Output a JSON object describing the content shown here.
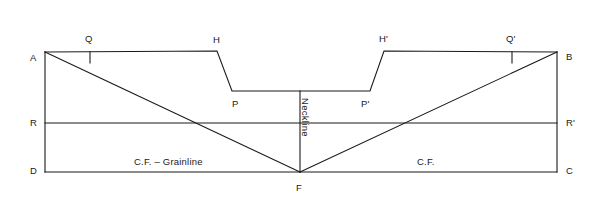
{
  "diagram": {
    "type": "pattern-draft",
    "canvas": {
      "width": 602,
      "height": 205
    },
    "style": {
      "line_color": "#1a1a1a",
      "background_color": "#ffffff",
      "line_width": 1.1,
      "text_color": "#1a1a1a"
    },
    "points": {
      "A": {
        "x": 45,
        "y": 52,
        "label": "A",
        "label_x": 30,
        "label_y": 53
      },
      "B": {
        "x": 557,
        "y": 52,
        "label": "B",
        "label_x": 566,
        "label_y": 52
      },
      "C": {
        "x": 557,
        "y": 172,
        "label": "C",
        "label_x": 566,
        "label_y": 166
      },
      "D": {
        "x": 45,
        "y": 172,
        "label": "D",
        "label_x": 30,
        "label_y": 166
      },
      "F": {
        "x": 300,
        "y": 172,
        "label": "F",
        "label_x": 296,
        "label_y": 183
      },
      "H": {
        "x": 217,
        "y": 51,
        "label": "H",
        "label_x": 213,
        "label_y": 36
      },
      "Hp": {
        "x": 384,
        "y": 51,
        "label": "H'",
        "label_x": 379,
        "label_y": 35
      },
      "P": {
        "x": 232,
        "y": 91,
        "label": "P",
        "label_x": 232,
        "label_y": 99
      },
      "Pp": {
        "x": 370,
        "y": 91,
        "label": "P'",
        "label_x": 361,
        "label_y": 99
      },
      "Q": {
        "x": 90,
        "y": 52,
        "label": "Q",
        "label_x": 85,
        "label_y": 35
      },
      "Qp": {
        "x": 512,
        "y": 52,
        "label": "Q'",
        "label_x": 507,
        "label_y": 35
      },
      "R": {
        "x": 45,
        "y": 123,
        "label": "R",
        "label_x": 30,
        "label_y": 118
      },
      "Rp": {
        "x": 557,
        "y": 123,
        "label": "R'",
        "label_x": 566,
        "label_y": 118
      }
    },
    "annotations": {
      "grainline": {
        "text": "C.F. – Grainline",
        "x": 173,
        "y": 158
      },
      "center_front": {
        "text": "C.F.",
        "x": 427,
        "y": 158
      },
      "neckline": {
        "text": "Neckline",
        "x": 304,
        "y": 98
      }
    },
    "ticks": {
      "Q": {
        "x": 90,
        "y_start": 52,
        "y_end": 63
      },
      "Qp": {
        "x": 512,
        "y_start": 52,
        "y_end": 63
      }
    },
    "segments": [
      {
        "name": "left-edge-AD",
        "from": "A",
        "to": "D"
      },
      {
        "name": "right-edge-BC",
        "from": "B",
        "to": "C"
      },
      {
        "name": "bottom-edge-DC",
        "from": "D",
        "to": "C"
      },
      {
        "name": "waist-line-RR",
        "from": "R",
        "to": "Rp"
      },
      {
        "name": "top-edge-AH",
        "from": "A",
        "to": "H"
      },
      {
        "name": "shoulder-slope-HP",
        "from": "H",
        "to": "P"
      },
      {
        "name": "neckline-base-PP",
        "from": "P",
        "to": "Pp"
      },
      {
        "name": "shoulder-slope-PpHp",
        "from": "Pp",
        "to": "Hp"
      },
      {
        "name": "top-edge-HpB",
        "from": "Hp",
        "to": "B"
      },
      {
        "name": "diagonal-AF",
        "from": "A",
        "to": "F"
      },
      {
        "name": "diagonal-BF",
        "from": "B",
        "to": "F"
      },
      {
        "name": "center-front-vertical",
        "from": "neckline-base-mid",
        "to": "F"
      }
    ]
  }
}
